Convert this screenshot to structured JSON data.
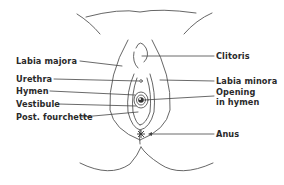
{
  "diagram": {
    "type": "anatomical-line-drawing",
    "colors": {
      "line": "#555555",
      "text": "#2a2a2a",
      "background": "#ffffff"
    },
    "labels_left": [
      {
        "id": "labia-majora",
        "text": "Labia majora"
      },
      {
        "id": "urethra",
        "text": "Urethra"
      },
      {
        "id": "hymen",
        "text": "Hymen"
      },
      {
        "id": "vestibule",
        "text": "Vestibule"
      },
      {
        "id": "post-fourchette",
        "text": "Post. fourchette"
      }
    ],
    "labels_right": [
      {
        "id": "clitoris",
        "text": "Clitoris"
      },
      {
        "id": "labia-minora",
        "text": "Labia minora"
      },
      {
        "id": "opening-in-hymen-line1",
        "text": "Opening"
      },
      {
        "id": "opening-in-hymen-line2",
        "text": "in hymen"
      },
      {
        "id": "anus",
        "text": "Anus"
      }
    ]
  }
}
